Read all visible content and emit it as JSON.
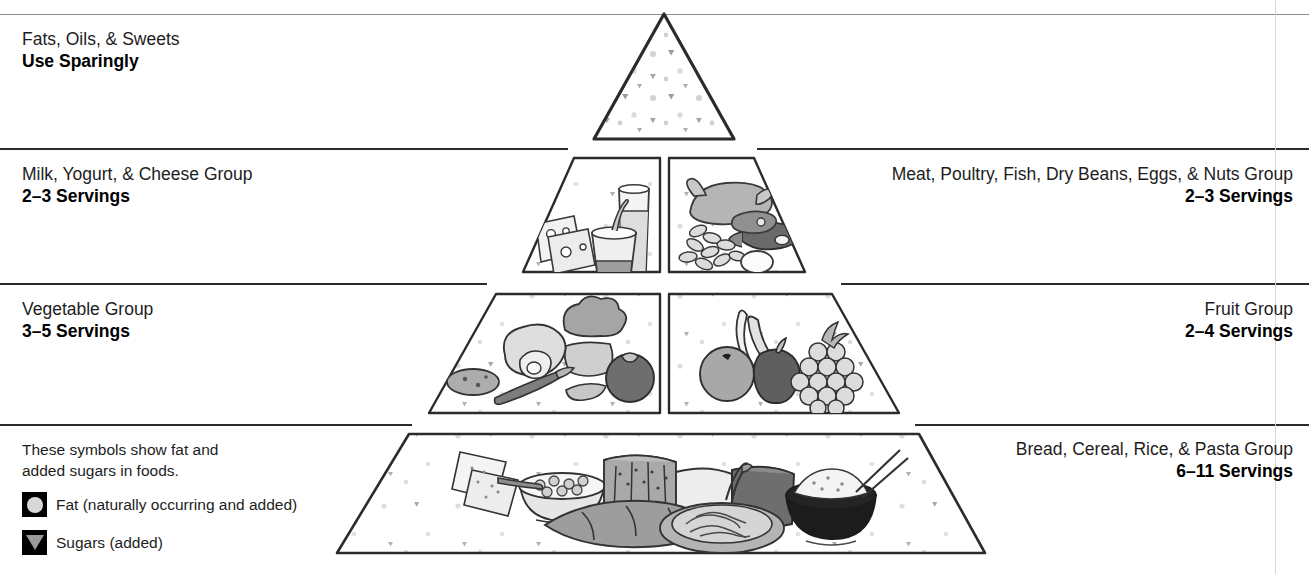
{
  "tiers": [
    {
      "id": "fats-oils-sweets",
      "group": "Fats, Oils, & Sweets",
      "servings": "Use Sparingly",
      "align": "left"
    },
    {
      "id": "milk-yogurt-cheese",
      "group": "Milk, Yogurt, & Cheese Group",
      "servings": "2–3 Servings",
      "align": "left"
    },
    {
      "id": "meat-poultry-fish",
      "group": "Meat, Poultry, Fish, Dry Beans, Eggs, & Nuts Group",
      "servings": "2–3 Servings",
      "align": "right"
    },
    {
      "id": "vegetable",
      "group": "Vegetable Group",
      "servings": "3–5 Servings",
      "align": "left"
    },
    {
      "id": "fruit",
      "group": "Fruit Group",
      "servings": "2–4 Servings",
      "align": "right"
    },
    {
      "id": "bread-cereal-rice-pasta",
      "group": "Bread, Cereal, Rice, & Pasta Group",
      "servings": "6–11 Servings",
      "align": "right"
    }
  ],
  "legend": {
    "intro_line1": "These symbols show fat and",
    "intro_line2": "added sugars in foods.",
    "items": [
      {
        "icon": "fat-circle-icon",
        "label": "Fat (naturally occurring and added)"
      },
      {
        "icon": "sugar-triangle-icon",
        "label": "Sugars (added)"
      }
    ]
  },
  "colors": {
    "outline": "#2b2b2b",
    "rule": "#2b2b2b",
    "rule_light": "#8e8e8e",
    "symbol_fat": "#d8d8d8",
    "symbol_sugar": "#9a9a9a",
    "swatch_bg": "#000000",
    "text": "#1d1d1d",
    "food_light": "#e3e3e3",
    "food_mid": "#b9b9b9",
    "food_dark": "#8a8a8a",
    "food_darker": "#5e5e5e",
    "background": "#ffffff"
  }
}
